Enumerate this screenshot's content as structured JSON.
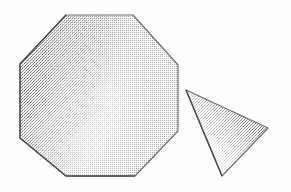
{
  "image": {
    "kind": "scanned-line-drawing",
    "width": 291,
    "height": 192,
    "background_color": "#fefefe",
    "texture": "halftone-dither",
    "caption": ""
  },
  "palette": {
    "background": "#fefefe",
    "outline": "#6e6e6e",
    "outline_dark": "#4a4a4a",
    "shade_dark": "#8a8a8a",
    "shade_mid": "#b5b5b5",
    "shade_light": "#e4e4e4",
    "shade_none": "#ffffff",
    "speckle": "#c9c9c9"
  },
  "shapes": [
    {
      "name": "octagon",
      "label": "Octagon",
      "sides": 8,
      "points": "66,15 133,15 178,65 178,131 135,176 66,176 20,138 20,64",
      "vertices": [
        [
          66,
          15
        ],
        [
          133,
          15
        ],
        [
          178,
          65
        ],
        [
          178,
          131
        ],
        [
          135,
          176
        ],
        [
          66,
          176
        ],
        [
          20,
          138
        ],
        [
          20,
          64
        ]
      ],
      "centroid": [
        99,
        96
      ],
      "shading": "gradient-left-dark-to-right-light",
      "light_direction": "from-right",
      "outline_width": 1.2
    },
    {
      "name": "triangle",
      "label": "Triangle",
      "sides": 3,
      "points": "186,90 268,128 222,176",
      "vertices": [
        [
          186,
          90
        ],
        [
          268,
          128
        ],
        [
          222,
          176
        ]
      ],
      "centroid": [
        225,
        131
      ],
      "shading": "gradient-lower-left-dark-to-upper-right-light",
      "light_direction": "from-upper-right",
      "outline_width": 1.2
    }
  ]
}
